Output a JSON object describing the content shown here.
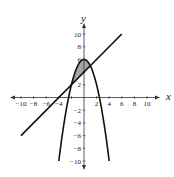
{
  "chart_data": {
    "type": "line",
    "title": "",
    "xlabel": "x",
    "ylabel": "y",
    "xlim": [
      -10,
      10
    ],
    "ylim": [
      -10,
      10
    ],
    "grid": false,
    "x_ticks": [
      -10,
      -8,
      -6,
      -4,
      2,
      4,
      6,
      8,
      10
    ],
    "y_ticks": [
      10,
      8,
      6,
      2,
      -2,
      -4,
      -6,
      -8,
      -10
    ],
    "x_tick_labels": [
      "−10",
      "−8",
      "−6",
      "−4",
      "2",
      "4",
      "6",
      "8",
      "10"
    ],
    "y_tick_labels": [
      "10",
      "8",
      "6",
      "2",
      "−2",
      "−4",
      "−6",
      "−8",
      "−10"
    ],
    "series": [
      {
        "name": "line",
        "equation": "y = x + 4",
        "x": [
          -10,
          6
        ],
        "y": [
          -6,
          10
        ]
      },
      {
        "name": "parabola",
        "equation": "y = 6 - x^2",
        "x": [
          -4,
          -3,
          -2,
          -1,
          0,
          1,
          2,
          3,
          4
        ],
        "y": [
          -10,
          -3,
          2,
          5,
          6,
          5,
          2,
          -3,
          -10
        ]
      }
    ],
    "shaded_region": {
      "between": [
        "parabola",
        "line"
      ],
      "x_range": [
        -2,
        1
      ],
      "intersections": [
        [
          -2,
          2
        ],
        [
          1,
          5
        ]
      ],
      "color": "#a6a6a6"
    }
  },
  "colors": {
    "curve": "#111111",
    "axis": "#333333",
    "shade": "#a6a6a6"
  }
}
